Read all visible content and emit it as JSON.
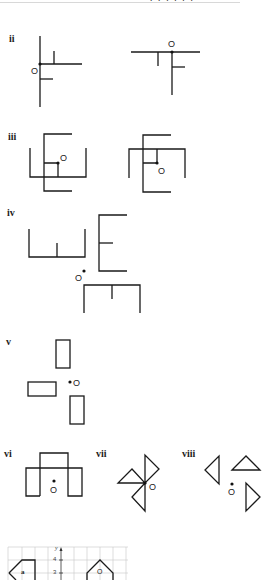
{
  "header": {
    "cut_off_text": "· · · · · ·"
  },
  "exercises": [
    {
      "id": "ii",
      "label": "ii",
      "description": "Two line figures each with centre of rotation O"
    },
    {
      "id": "iii",
      "label": "iii",
      "description": "Two square-frame line figures with centre O"
    },
    {
      "id": "iv",
      "label": "iv",
      "description": "Three bracket shapes arranged around point O"
    },
    {
      "id": "v",
      "label": "v",
      "description": "Three rectangles arranged around point O"
    },
    {
      "id": "vi",
      "label": "vi",
      "description": "Arch-like shape with point O"
    },
    {
      "id": "vii",
      "label": "vii",
      "description": "Three triangles meeting at point O"
    },
    {
      "id": "viii",
      "label": "viii",
      "description": "Three triangles arranged around point O"
    }
  ],
  "point_label": "O",
  "grid_figure": {
    "axis_label_y": "y",
    "y_ticks": [
      "4",
      "3"
    ],
    "shape_a_label": "a",
    "shape_o_label": "O"
  }
}
